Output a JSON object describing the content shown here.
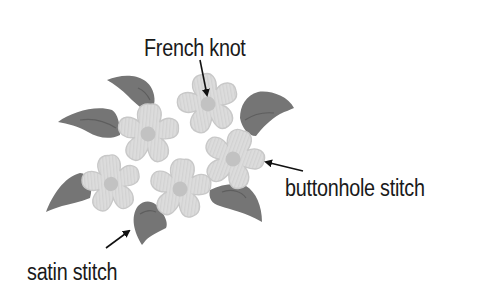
{
  "diagram": {
    "labels": {
      "french_knot": "French knot",
      "buttonhole_stitch": "buttonhole stitch",
      "satin_stitch": "satin stitch"
    },
    "colors": {
      "background": "#ffffff",
      "leaf": "#757575",
      "leaf_vein": "#5e5e5e",
      "petal": "#dcdcdc",
      "petal_edge": "#c8c8c8",
      "center": "#c2c2c2",
      "arrow": "#111111",
      "text": "#1a1a1a"
    },
    "flowers": [
      {
        "name": "flower-upper-left",
        "cx": 148,
        "cy": 134
      },
      {
        "name": "flower-top",
        "cx": 208,
        "cy": 104
      },
      {
        "name": "flower-right",
        "cx": 233,
        "cy": 159
      },
      {
        "name": "flower-bottom-center",
        "cx": 180,
        "cy": 189
      },
      {
        "name": "flower-left",
        "cx": 111,
        "cy": 184
      }
    ]
  }
}
